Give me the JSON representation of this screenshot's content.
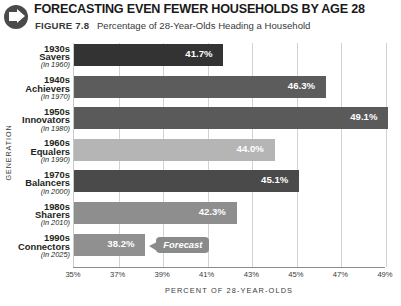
{
  "header": {
    "icon": "right-arrow-circle-icon",
    "title": "FORECASTING EVEN FEWER HOUSEHOLDS BY AGE 28",
    "figure_number": "FIGURE 7.8",
    "figure_caption": "Percentage of 28-Year-Olds Heading a Household"
  },
  "annotations": {
    "forecast_label": "Forecast"
  },
  "chart_data": {
    "type": "bar",
    "orientation": "horizontal",
    "title": "FORECASTING EVEN FEWER HOUSEHOLDS BY AGE 28",
    "subtitle": "Percentage of 28-Year-Olds Heading a Household",
    "xlabel": "PERCENT OF 28-YEAR-OLDS",
    "ylabel": "GENERATION",
    "xlim": [
      35,
      49
    ],
    "xticks": [
      35,
      37,
      39,
      41,
      43,
      45,
      47,
      49
    ],
    "xtick_labels": [
      "35%",
      "37%",
      "39%",
      "41%",
      "43%",
      "45%",
      "47%",
      "49%"
    ],
    "grid": true,
    "legend": "none",
    "categories": [
      "1930s Savers (in 1960)",
      "1940s Achievers (in 1970)",
      "1950s Innovators (in 1980)",
      "1960s Equalers (in 1990)",
      "1970s Balancers (in 2000)",
      "1980s Sharers (in 2010)",
      "1990s Connectors (in 2025)"
    ],
    "values": [
      41.7,
      46.3,
      49.1,
      44.0,
      45.1,
      42.3,
      38.2
    ],
    "value_labels": [
      "41.7%",
      "46.3%",
      "49.1%",
      "44.0%",
      "45.1%",
      "42.3%",
      "38.2%"
    ],
    "bars": [
      {
        "decade": "1930s",
        "name": "Savers",
        "year": "(in 1960)",
        "value": 41.7,
        "label": "41.7%",
        "color": "#333333"
      },
      {
        "decade": "1940s",
        "name": "Achievers",
        "year": "(in 1970)",
        "value": 46.3,
        "label": "46.3%",
        "color": "#5c5c5c"
      },
      {
        "decade": "1950s",
        "name": "Innovators",
        "year": "(in 1980)",
        "value": 49.1,
        "label": "49.1%",
        "color": "#5a5a5a"
      },
      {
        "decade": "1960s",
        "name": "Equalers",
        "year": "(in 1990)",
        "value": 44.0,
        "label": "44.0%",
        "color": "#b5b5b5"
      },
      {
        "decade": "1970s",
        "name": "Balancers",
        "year": "(in 2000)",
        "value": 45.1,
        "label": "45.1%",
        "color": "#4a4a4a"
      },
      {
        "decade": "1980s",
        "name": "Sharers",
        "year": "(in 2010)",
        "value": 42.3,
        "label": "42.3%",
        "color": "#8e8e8e"
      },
      {
        "decade": "1990s",
        "name": "Connectors",
        "year": "(in 2025)",
        "value": 38.2,
        "label": "38.2%",
        "color": "#909090"
      }
    ],
    "annotation": "Forecast",
    "colors": {
      "grid": "#d2d2d2",
      "axis": "#8c8c8c",
      "text": "#231f20",
      "value_text": "#ffffff",
      "callout": "#8a8a8a"
    }
  }
}
